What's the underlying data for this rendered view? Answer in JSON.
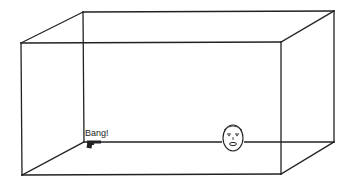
{
  "diagram": {
    "type": "3d-box-perspective",
    "box": {
      "front": {
        "x1": 21,
        "y1": 43,
        "x2": 281,
        "y2": 174
      },
      "back": {
        "x1": 83,
        "y1": 12,
        "x2": 334,
        "y2": 142
      }
    },
    "objects": [
      {
        "name": "gun",
        "icon": "pistol-icon",
        "position": [
          92,
          144
        ]
      },
      {
        "name": "face",
        "icon": "face-icon",
        "position": [
          233,
          138
        ]
      }
    ],
    "annotations": [
      {
        "text": "Bang!",
        "anchor": "gun"
      }
    ],
    "colors": {
      "line": "#222222",
      "background": "#ffffff"
    }
  }
}
